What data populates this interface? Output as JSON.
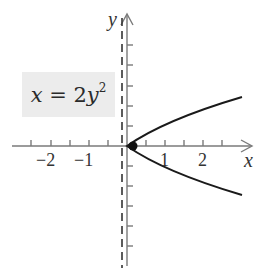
{
  "figure": {
    "equation": {
      "lhs": "x",
      "eq": " = 2",
      "var": "y",
      "exp": "2",
      "full": "x = 2y^2"
    },
    "axes": {
      "x_label": "x",
      "y_label": "y",
      "x_tick_labels": [
        {
          "value": -2,
          "text": "−2"
        },
        {
          "value": -1,
          "text": "−1"
        },
        {
          "value": 1,
          "text": "1"
        },
        {
          "value": 2,
          "text": "2"
        }
      ],
      "x_tick_step": 0.5,
      "y_tick_step": 0.5
    },
    "curve": {
      "equation": "x = 2y^2",
      "type": "parabola",
      "opens": "right",
      "vertex": [
        0,
        0
      ]
    },
    "focus": {
      "point": [
        0.125,
        0
      ],
      "marker": "filled-dot"
    },
    "directrix": {
      "equation": "x = -1/8",
      "style": "dashed"
    },
    "colors": {
      "curve": "#1a1a1a",
      "axes": "#7a7a7a",
      "directrix": "#333333",
      "box_fill": "#ececec",
      "text": "#333333"
    }
  }
}
